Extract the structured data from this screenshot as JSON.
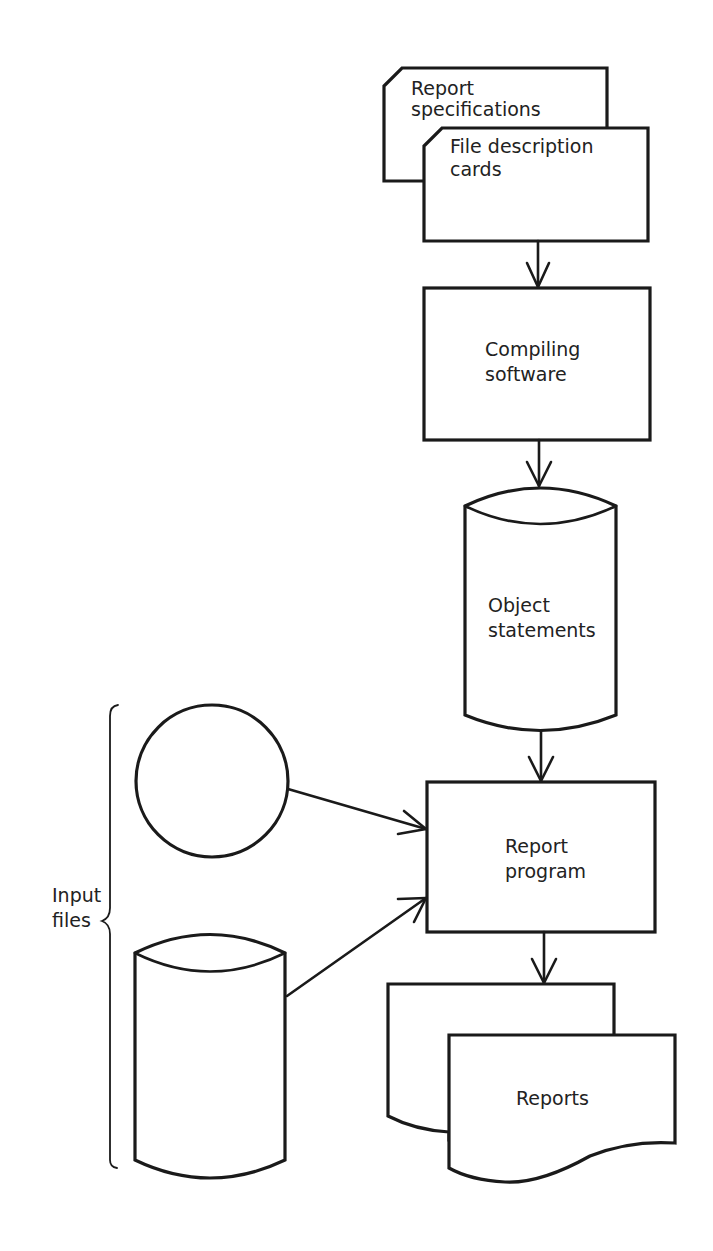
{
  "diagram": {
    "type": "flowchart",
    "colors": {
      "stroke": "#1a1a1a",
      "text": "#222222",
      "background": "#ffffff"
    },
    "nodes": {
      "report_specifications": {
        "shape": "punched-card",
        "line1": "Report",
        "line2": "specifications"
      },
      "file_description_cards": {
        "shape": "punched-card",
        "line1": "File description",
        "line2": "cards"
      },
      "compiling_software": {
        "shape": "process-box",
        "line1": "Compiling",
        "line2": "software"
      },
      "object_statements": {
        "shape": "cylinder-storage",
        "line1": "Object",
        "line2": "statements"
      },
      "input_file_tape": {
        "shape": "circle-magnetic-tape",
        "label": ""
      },
      "input_file_disk": {
        "shape": "cylinder-storage",
        "label": ""
      },
      "report_program": {
        "shape": "process-box",
        "line1": "Report",
        "line2": "program"
      },
      "reports_back": {
        "shape": "document",
        "label": ""
      },
      "reports": {
        "shape": "document",
        "label": "Reports"
      }
    },
    "group_label": {
      "line1": "Input",
      "line2": "files"
    },
    "edges": [
      {
        "from": "file_description_cards",
        "to": "compiling_software"
      },
      {
        "from": "compiling_software",
        "to": "object_statements"
      },
      {
        "from": "object_statements",
        "to": "report_program"
      },
      {
        "from": "input_file_tape",
        "to": "report_program"
      },
      {
        "from": "input_file_disk",
        "to": "report_program"
      },
      {
        "from": "report_program",
        "to": "reports"
      }
    ]
  }
}
